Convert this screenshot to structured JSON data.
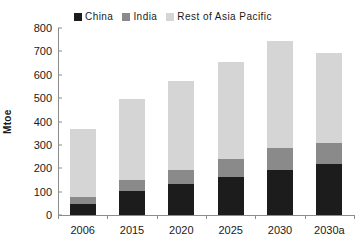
{
  "chart_data": {
    "type": "bar",
    "stacked": true,
    "title": "",
    "xlabel": "",
    "ylabel": "Mtoe",
    "ylim": [
      0,
      800
    ],
    "ytick_step": 100,
    "yticks": [
      "0",
      "100",
      "200",
      "300",
      "400",
      "500",
      "600",
      "700",
      "800"
    ],
    "grid": false,
    "legend_position": "top",
    "categories": [
      "2006",
      "2015",
      "2020",
      "2025",
      "2030",
      "2030a"
    ],
    "series": [
      {
        "name": "China",
        "color": "#1c1c1c",
        "values": [
          48,
          103,
          133,
          163,
          192,
          218
        ]
      },
      {
        "name": "India",
        "color": "#8a8a8a",
        "values": [
          30,
          47,
          60,
          77,
          96,
          92
        ]
      },
      {
        "name": "Rest of Asia Pacific",
        "color": "#d5d5d5",
        "values": [
          290,
          345,
          382,
          415,
          457,
          383
        ]
      }
    ],
    "cumulative_tops": [
      [
        48,
        78,
        368
      ],
      [
        103,
        150,
        495
      ],
      [
        133,
        193,
        575
      ],
      [
        163,
        240,
        655
      ],
      [
        192,
        288,
        745
      ],
      [
        218,
        310,
        693
      ]
    ],
    "totals": [
      368,
      495,
      575,
      655,
      745,
      693
    ]
  },
  "legend": {
    "items": [
      {
        "label": "China",
        "color": "#1c1c1c",
        "icon": "square-swatch-icon"
      },
      {
        "label": "India",
        "color": "#8a8a8a",
        "icon": "square-swatch-icon"
      },
      {
        "label": "Rest of Asia Pacific",
        "color": "#d5d5d5",
        "icon": "square-swatch-icon"
      }
    ]
  },
  "axes": {
    "y_title": "Mtoe",
    "axis_color": "#8c8c8c",
    "text_color": "#1a1a1a"
  }
}
